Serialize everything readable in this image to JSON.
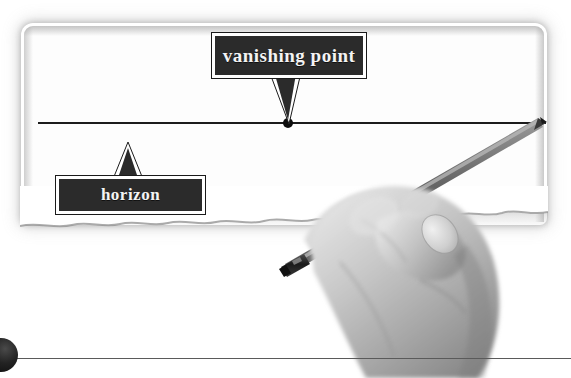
{
  "scene": {
    "title": "vanishing point and horizon perspective diagram",
    "background_color": "#ffffff",
    "width": 571,
    "height": 378
  },
  "paper": {
    "name": "drawing paper sheet",
    "fill_color": "#fdfdfd",
    "edge_shadow_color": "#787878",
    "bottom_edge_style": "torn deckled edge"
  },
  "horizon": {
    "line_label": "horizon line",
    "line_color": "#1c1c1c",
    "line_y": 122,
    "line_start_x": 38,
    "line_end_x": 546
  },
  "vanishing_point": {
    "dot_label": "vanishing point dot",
    "dot_color": "#0d0d0d",
    "dot_x": 288,
    "dot_y": 123
  },
  "callouts": [
    {
      "id": "vanishing-point",
      "label": "vanishing point",
      "box_color": "#2b2b2b",
      "border_color": "#ffffff",
      "text_color": "#f4f4f4",
      "pointer": "down"
    },
    {
      "id": "horizon",
      "label": "horizon",
      "box_color": "#2b2b2b",
      "border_color": "#ffffff",
      "text_color": "#f4f4f4",
      "pointer": "up"
    }
  ],
  "hand": {
    "label": "hand holding pencil",
    "skin_tone": "#b9b9b9",
    "rendering": "grayscale photograph"
  },
  "pencil": {
    "label": "pencil",
    "body_color": "#6e6e6e",
    "ferrule_color": "#262626",
    "tip_x": 546,
    "tip_y": 123
  },
  "footer": {
    "rule_label": "bottom horizontal rule",
    "rule_color": "#5a5a5a",
    "sphere_label": "page corner sphere",
    "sphere_color": "#232323"
  }
}
